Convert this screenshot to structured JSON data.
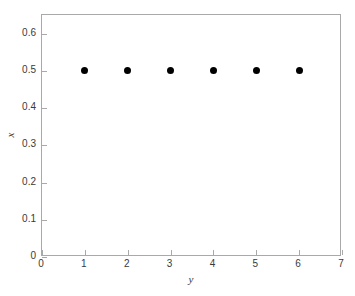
{
  "figure": {
    "background_color": "#ffffff",
    "axis_color": "#a9a9a9",
    "text_color": "#3a3a3a",
    "marker_color": "#000000"
  },
  "chart_data": {
    "type": "scatter",
    "title": "",
    "subtitle": "",
    "xlabel": "y",
    "ylabel": "x",
    "xlim": [
      0,
      7
    ],
    "ylim": [
      0,
      0.65
    ],
    "grid": false,
    "legend": null,
    "xticks": [
      0,
      1,
      2,
      3,
      4,
      5,
      6,
      7
    ],
    "xticklabels": [
      "0",
      "1",
      "2",
      "3",
      "4",
      "5",
      "6",
      "7"
    ],
    "yticks": [
      0,
      0.1,
      0.2,
      0.3,
      0.4,
      0.5,
      0.6
    ],
    "yticklabels": [
      "0",
      "0.1",
      "0.2",
      "0.3",
      "0.4",
      "0.5",
      "0.6"
    ],
    "series": [
      {
        "name": "",
        "marker": "filled-circle",
        "color": "#000000",
        "x": [
          1,
          2,
          3,
          4,
          5,
          6
        ],
        "y": [
          0.5,
          0.5,
          0.5,
          0.5,
          0.5,
          0.5
        ],
        "points": [
          {
            "x": 1,
            "y": 0.5
          },
          {
            "x": 2,
            "y": 0.5
          },
          {
            "x": 3,
            "y": 0.5
          },
          {
            "x": 4,
            "y": 0.5
          },
          {
            "x": 5,
            "y": 0.5
          },
          {
            "x": 6,
            "y": 0.5
          }
        ]
      }
    ]
  }
}
